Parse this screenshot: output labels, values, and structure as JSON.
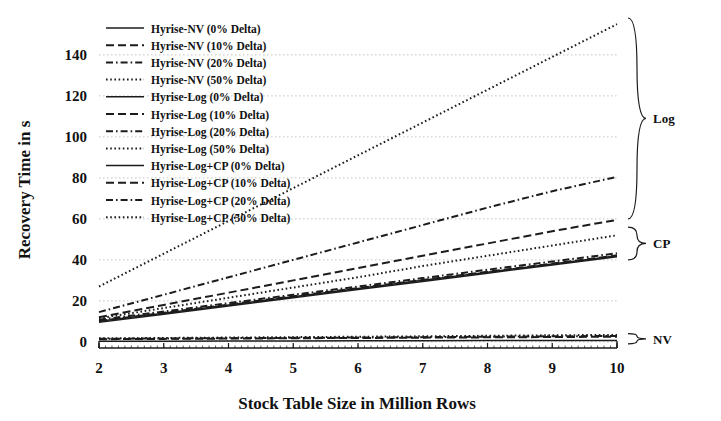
{
  "chart_data": {
    "type": "line",
    "title": "",
    "xlabel": "Stock Table Size in Million Rows",
    "ylabel": "Recovery Time in s",
    "xlim": [
      2,
      10
    ],
    "ylim": [
      -3,
      158
    ],
    "xticks": [
      2,
      3,
      4,
      5,
      6,
      7,
      8,
      9,
      10
    ],
    "yticks": [
      0,
      20,
      40,
      60,
      80,
      100,
      120,
      140
    ],
    "grid": true,
    "legend_position": "upper-left-inside",
    "x": [
      2,
      3,
      4,
      5,
      6,
      7,
      8,
      9,
      10
    ],
    "series": [
      {
        "name": "Hyrise-NV (0% Delta)",
        "group": "NV",
        "style": "solid",
        "values": [
          0.3,
          0.35,
          0.4,
          0.45,
          0.5,
          0.55,
          0.6,
          0.65,
          0.7
        ]
      },
      {
        "name": "Hyrise-NV (10% Delta)",
        "group": "NV",
        "style": "dashed",
        "values": [
          1.3,
          1.45,
          1.6,
          1.75,
          1.9,
          2.05,
          2.2,
          2.35,
          2.5
        ]
      },
      {
        "name": "Hyrise-NV (20% Delta)",
        "group": "NV",
        "style": "dashdot",
        "values": [
          1.5,
          1.65,
          1.8,
          1.95,
          2.1,
          2.3,
          2.5,
          2.7,
          2.9
        ]
      },
      {
        "name": "Hyrise-NV (50% Delta)",
        "group": "NV",
        "style": "dotted",
        "values": [
          1.7,
          1.9,
          2.1,
          2.3,
          2.5,
          2.7,
          2.95,
          3.2,
          3.4
        ]
      },
      {
        "name": "Hyrise-Log (0% Delta)",
        "group": "Log",
        "style": "solid",
        "values": [
          10.0,
          14.0,
          18.0,
          22.0,
          26.0,
          30.0,
          34.0,
          38.0,
          42.0
        ]
      },
      {
        "name": "Hyrise-Log (10% Delta)",
        "group": "Log",
        "style": "dashed",
        "values": [
          12.0,
          18.0,
          24.0,
          30.0,
          36.0,
          42.0,
          48.0,
          54.0,
          59.5
        ]
      },
      {
        "name": "Hyrise-Log (20% Delta)",
        "group": "Log",
        "style": "dashdot",
        "values": [
          14.5,
          23.0,
          31.5,
          40.0,
          48.5,
          57.0,
          65.5,
          73.5,
          80.5
        ]
      },
      {
        "name": "Hyrise-Log (50% Delta)",
        "group": "Log",
        "style": "dotted",
        "values": [
          27.0,
          43.0,
          59.0,
          75.0,
          91.0,
          107.0,
          123.0,
          139.0,
          155.0
        ]
      },
      {
        "name": "Hyrise-Log+CP (0% Delta)",
        "group": "CP",
        "style": "solid",
        "values": [
          9.5,
          13.5,
          17.5,
          21.5,
          25.5,
          29.5,
          33.5,
          37.5,
          41.5
        ]
      },
      {
        "name": "Hyrise-Log+CP (10% Delta)",
        "group": "CP",
        "style": "dashed",
        "values": [
          10.2,
          14.2,
          18.2,
          22.2,
          26.2,
          30.2,
          34.2,
          38.2,
          42.2
        ]
      },
      {
        "name": "Hyrise-Log+CP (20% Delta)",
        "group": "CP",
        "style": "dashdot",
        "values": [
          10.8,
          14.8,
          18.9,
          23.0,
          27.0,
          31.1,
          35.2,
          39.2,
          43.2
        ]
      },
      {
        "name": "Hyrise-Log+CP (50% Delta)",
        "group": "CP",
        "style": "dotted",
        "values": [
          11.5,
          16.5,
          21.5,
          26.5,
          31.5,
          37.0,
          42.0,
          47.0,
          52.0
        ]
      }
    ],
    "annotations": [
      {
        "label": "Log",
        "y_range": [
          60,
          158
        ]
      },
      {
        "label": "CP",
        "y_range": [
          40,
          56
        ]
      },
      {
        "label": "NV",
        "y_range": [
          -1,
          4
        ]
      }
    ]
  }
}
